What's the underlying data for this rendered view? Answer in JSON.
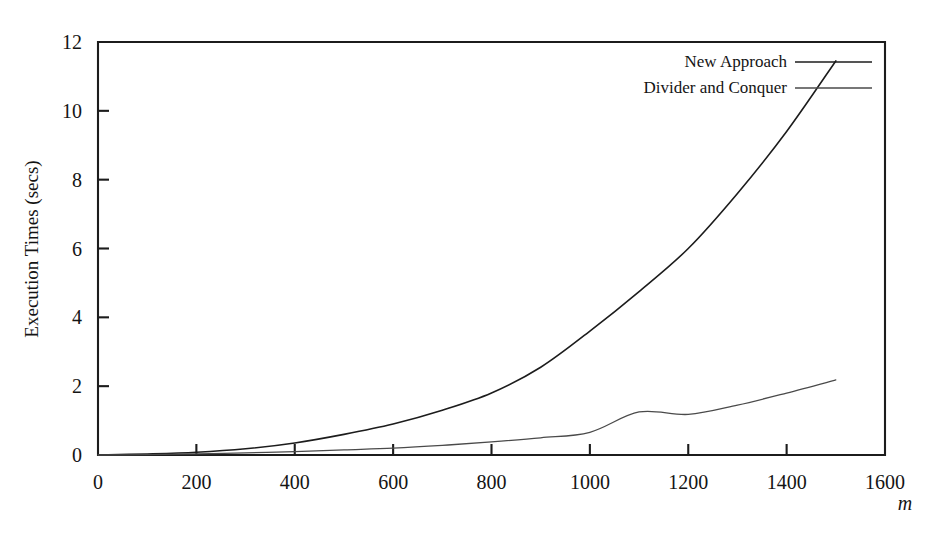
{
  "chart_data": {
    "type": "line",
    "title": "",
    "xlabel": "m",
    "ylabel": "Execution Times (secs)",
    "xlim": [
      0,
      1600
    ],
    "ylim": [
      0,
      12
    ],
    "xticks": [
      0,
      200,
      400,
      600,
      800,
      1000,
      1200,
      1400,
      1600
    ],
    "xtick_labels": [
      "0",
      "200",
      "400",
      "600",
      "800",
      "1000",
      "1200",
      "1400",
      "1600"
    ],
    "yticks": [
      0,
      2,
      4,
      6,
      8,
      10,
      12
    ],
    "ytick_labels": [
      "0",
      "2",
      "4",
      "6",
      "8",
      "10",
      "12"
    ],
    "grid": false,
    "legend_position": "top-right",
    "series": [
      {
        "name": "New Approach",
        "color": "#1c1c1c",
        "linewidth": 1.6,
        "x": [
          0,
          100,
          200,
          300,
          400,
          500,
          600,
          700,
          800,
          900,
          1000,
          1100,
          1200,
          1300,
          1400,
          1500
        ],
        "values": [
          0.0,
          0.03,
          0.08,
          0.18,
          0.35,
          0.6,
          0.9,
          1.3,
          1.8,
          2.55,
          3.6,
          4.75,
          6.0,
          7.6,
          9.4,
          11.45
        ]
      },
      {
        "name": "Divider and Conquer",
        "color": "#4a4a4a",
        "linewidth": 1.3,
        "x": [
          0,
          100,
          200,
          300,
          400,
          500,
          600,
          700,
          800,
          900,
          1000,
          1100,
          1200,
          1300,
          1400,
          1500
        ],
        "values": [
          0.0,
          0.01,
          0.03,
          0.06,
          0.1,
          0.15,
          0.2,
          0.28,
          0.38,
          0.5,
          0.66,
          1.25,
          1.18,
          1.45,
          1.8,
          2.18
        ]
      }
    ]
  },
  "legend": {
    "entries": [
      {
        "label": "New Approach"
      },
      {
        "label": "Divider and Conquer"
      }
    ]
  },
  "axes": {
    "y_title": "Execution Times (secs)",
    "x_title": "m"
  }
}
